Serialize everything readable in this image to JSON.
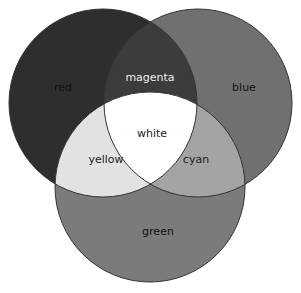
{
  "diagram": {
    "type": "venn",
    "circles": [
      {
        "name": "red",
        "cx": 103,
        "cy": 103,
        "r": 94,
        "fill": "#2e2e2e"
      },
      {
        "name": "blue",
        "cx": 198,
        "cy": 103,
        "r": 94,
        "fill": "#707070"
      },
      {
        "name": "green",
        "cx": 150,
        "cy": 187,
        "r": 95,
        "fill": "#7b7b7b"
      }
    ],
    "overlaps": {
      "magenta": {
        "fill": "#3c3c3c"
      },
      "yellow": {
        "fill": "#e2e2e2"
      },
      "cyan": {
        "fill": "#a4a4a4"
      },
      "white": {
        "fill": "#ffffff"
      }
    },
    "labels": {
      "red": {
        "text": "red",
        "x": 63,
        "y": 88,
        "color": "#111111"
      },
      "magenta": {
        "text": "magenta",
        "x": 150,
        "y": 78,
        "color": "#eeeeee"
      },
      "blue": {
        "text": "blue",
        "x": 244,
        "y": 88,
        "color": "#111111"
      },
      "white": {
        "text": "white",
        "x": 152,
        "y": 134,
        "color": "#222222"
      },
      "yellow": {
        "text": "yellow",
        "x": 106,
        "y": 160,
        "color": "#222222"
      },
      "cyan": {
        "text": "cyan",
        "x": 196,
        "y": 160,
        "color": "#222222"
      },
      "green": {
        "text": "green",
        "x": 158,
        "y": 232,
        "color": "#111111"
      }
    },
    "stroke": "#333333"
  }
}
